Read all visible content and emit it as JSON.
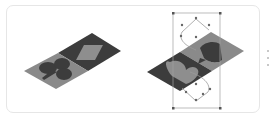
{
  "figure": {
    "colors": {
      "dark": "#3c3c3c",
      "light": "#8a8a8a",
      "handle": "#555555",
      "outline": "#9a9a9a",
      "card_border": "#e6e6e6"
    },
    "left_tile": {
      "suits": [
        "club",
        "diamond"
      ],
      "state": "normal"
    },
    "right_tile": {
      "suits": [
        "heart",
        "spade"
      ],
      "state": "selected",
      "selection_handles": 6,
      "path_anchors": 10
    }
  }
}
